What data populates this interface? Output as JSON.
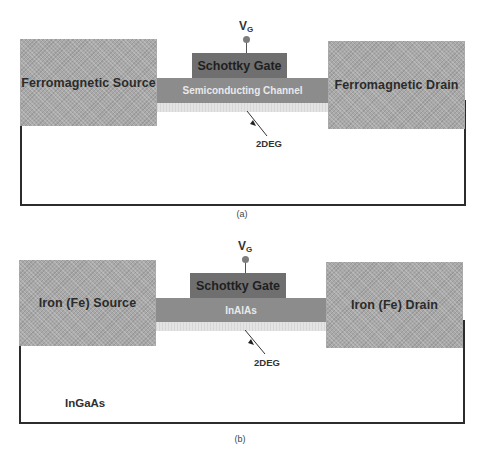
{
  "figure": {
    "panels": [
      {
        "id": "a",
        "caption": "(a)",
        "gate_voltage": {
          "main": "V",
          "sub": "G"
        },
        "gate_label": "Schottky Gate",
        "channel_label": "Semiconducting Channel",
        "source_label": "Ferromagnetic Source",
        "drain_label": "Ferromagnetic Drain",
        "deg_label": "2DEG",
        "substrate_label": ""
      },
      {
        "id": "b",
        "caption": "(b)",
        "gate_voltage": {
          "main": "V",
          "sub": "G"
        },
        "gate_label": "Schottky Gate",
        "channel_label": "InAlAs",
        "source_label": "Iron (Fe) Source",
        "drain_label": "Iron (Fe) Drain",
        "deg_label": "2DEG",
        "substrate_label": "InGaAs"
      }
    ],
    "colors": {
      "contact": "#a9a9a9",
      "gate": "#6f6f6f",
      "channel": "#8c8c8c",
      "two_deg": "#e4e4e4",
      "outline": "#2c2c2c"
    }
  }
}
